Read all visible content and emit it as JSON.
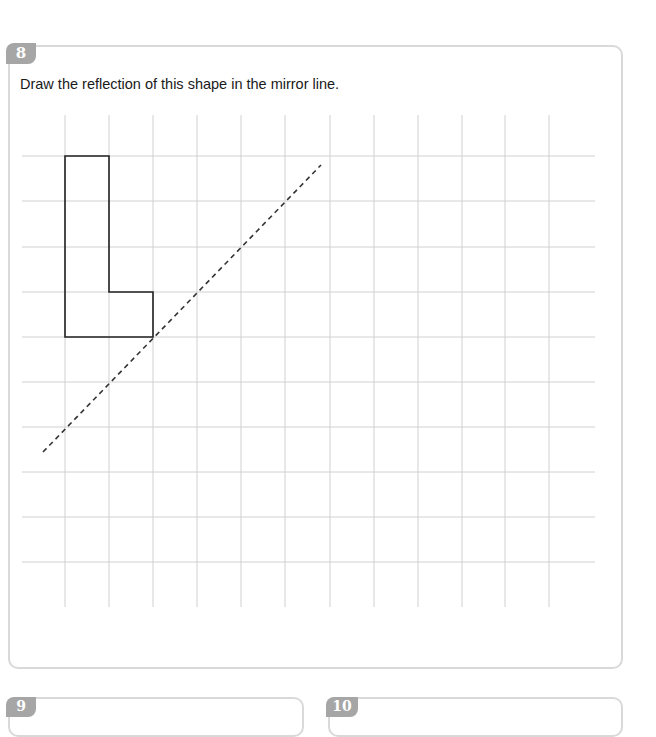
{
  "question": {
    "number": "8",
    "text": "Draw the reflection of this shape in the mirror line."
  },
  "grid": {
    "vertical_lines_x": [
      65,
      109,
      153,
      197,
      241,
      285,
      330,
      374,
      418,
      462,
      505,
      549
    ],
    "horizontal_lines_y": [
      156,
      201,
      247,
      292,
      337,
      382,
      427,
      472,
      517,
      562
    ],
    "v_top": 115,
    "v_bottom": 607,
    "h_left": 22,
    "h_right": 595,
    "line_color": "#d0d0d0"
  },
  "shape": {
    "name": "L-shape",
    "points": "65,156 109,156 109,292 153,292 153,337 65,337",
    "stroke": "#222222"
  },
  "mirror_line": {
    "x1": 43,
    "y1": 452,
    "x2": 321,
    "y2": 165,
    "stroke": "#333333",
    "dash": "5,4"
  },
  "next_questions": [
    {
      "number": "9"
    },
    {
      "number": "10"
    }
  ]
}
